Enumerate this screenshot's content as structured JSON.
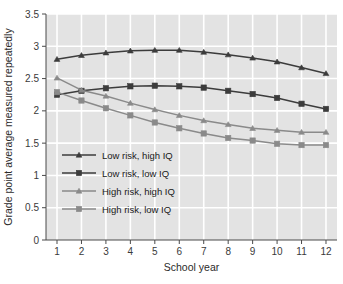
{
  "chart_data": {
    "type": "line",
    "title": "",
    "xlabel": "School year",
    "ylabel": "Grade point average measured repeatedly",
    "x": [
      1,
      2,
      3,
      4,
      5,
      6,
      7,
      8,
      9,
      10,
      11,
      12
    ],
    "xtick_labels": [
      "1",
      "2",
      "3",
      "4",
      "5",
      "6",
      "7",
      "8",
      "9",
      "10",
      "11",
      "12"
    ],
    "ytick_labels": [
      "0",
      "0.5",
      "1",
      "1.5",
      "2",
      "2.5",
      "3",
      "3.5"
    ],
    "yticks": [
      0,
      0.5,
      1,
      1.5,
      2,
      2.5,
      3,
      3.5
    ],
    "xlim": [
      0.55,
      12.45
    ],
    "ylim": [
      0,
      3.5
    ],
    "grid": true,
    "grid_color": "#ffffff",
    "plot_background": "#e3e3e3",
    "legend_position": "center-left",
    "series": [
      {
        "name": "Low risk, high IQ",
        "marker": "triangle",
        "color": "#3c3c3c",
        "values": [
          2.8,
          2.86,
          2.9,
          2.93,
          2.94,
          2.94,
          2.91,
          2.87,
          2.82,
          2.76,
          2.67,
          2.58
        ]
      },
      {
        "name": "Low risk, low IQ",
        "marker": "square",
        "color": "#3c3c3c",
        "values": [
          2.25,
          2.31,
          2.35,
          2.38,
          2.39,
          2.38,
          2.36,
          2.31,
          2.26,
          2.2,
          2.11,
          2.03
        ]
      },
      {
        "name": "High risk, high IQ",
        "marker": "triangle",
        "color": "#8a8a8a",
        "values": [
          2.51,
          2.32,
          2.23,
          2.12,
          2.02,
          1.93,
          1.85,
          1.79,
          1.73,
          1.7,
          1.67,
          1.67
        ]
      },
      {
        "name": "High risk, low IQ",
        "marker": "square",
        "color": "#8a8a8a",
        "values": [
          2.29,
          2.16,
          2.04,
          1.93,
          1.82,
          1.73,
          1.65,
          1.58,
          1.54,
          1.49,
          1.47,
          1.47
        ]
      }
    ]
  },
  "legend": {
    "items": [
      {
        "label": "Low risk, high IQ"
      },
      {
        "label": "Low risk, low IQ"
      },
      {
        "label": "High risk, high IQ"
      },
      {
        "label": "High risk, low IQ"
      }
    ]
  }
}
